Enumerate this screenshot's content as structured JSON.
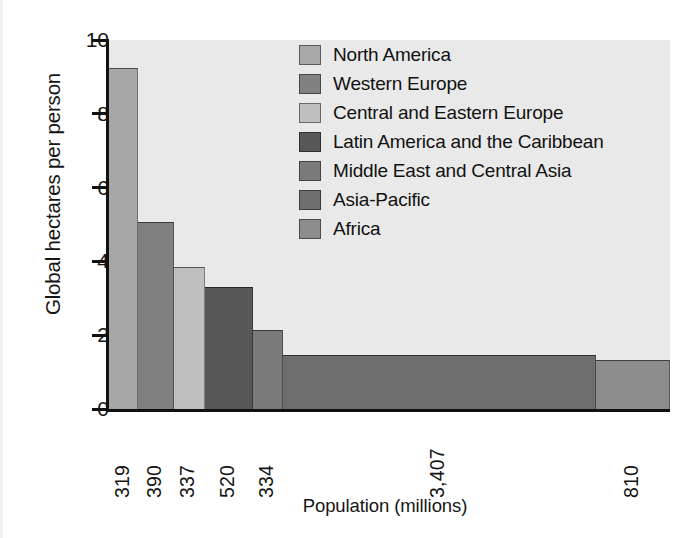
{
  "chart_data": {
    "type": "bar",
    "title": "",
    "subtitle": "",
    "xlabel": "Population (millions)",
    "ylabel": "Global hectares per person",
    "ylim": [
      0,
      10
    ],
    "yticks": [
      0,
      2,
      4,
      6,
      8,
      10
    ],
    "ytick_labels": [
      "0",
      "2",
      "4",
      "6",
      "8",
      "10"
    ],
    "grid": false,
    "legend_position": "upper-right-inside",
    "variable_width": true,
    "width_units": "population (millions)",
    "note": "Marimekko-style chart: bar width encodes population, bar height encodes global hectares per person.",
    "categories": [
      "North America",
      "Western Europe",
      "Central and Eastern Europe",
      "Latin America and the Caribbean",
      "Middle East and Central Asia",
      "Asia-Pacific",
      "Africa"
    ],
    "xtick_labels": [
      "319",
      "390",
      "337",
      "520",
      "334",
      "3,407",
      "810"
    ],
    "widths": [
      319,
      390,
      337,
      520,
      334,
      3407,
      810
    ],
    "values": [
      9.24,
      5.08,
      3.85,
      3.3,
      2.15,
      1.47,
      1.32
    ],
    "colors": [
      "#a8a8a8",
      "#808080",
      "#c0c0c0",
      "#585858",
      "#7a7a7a",
      "#6e6e6e",
      "#8d8d8d"
    ],
    "plot_background": "#ebebeb",
    "axis_color": "#111111"
  },
  "legend": {
    "items": [
      {
        "label": "North America",
        "color": "#a8a8a8"
      },
      {
        "label": "Western Europe",
        "color": "#808080"
      },
      {
        "label": "Central and Eastern Europe",
        "color": "#c0c0c0"
      },
      {
        "label": "Latin America and the Caribbean",
        "color": "#585858"
      },
      {
        "label": "Middle East and Central Asia",
        "color": "#7a7a7a"
      },
      {
        "label": "Asia-Pacific",
        "color": "#6e6e6e"
      },
      {
        "label": "Africa",
        "color": "#8d8d8d"
      }
    ]
  }
}
